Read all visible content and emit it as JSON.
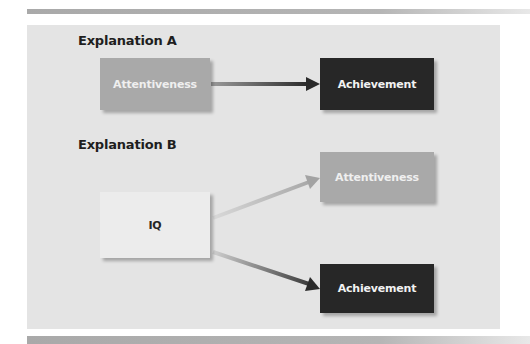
{
  "diagram": {
    "explanation_a": {
      "heading": "Explanation A",
      "nodes": [
        {
          "id": "attentiveness_a",
          "label": "Attentiveness",
          "color": "#a9a9a9"
        },
        {
          "id": "achievement_a",
          "label": "Achievement",
          "color": "#272727"
        }
      ],
      "edges": [
        {
          "from": "attentiveness_a",
          "to": "achievement_a"
        }
      ]
    },
    "explanation_b": {
      "heading": "Explanation B",
      "nodes": [
        {
          "id": "iq",
          "label": "IQ",
          "color": "#ececec"
        },
        {
          "id": "attentiveness_b",
          "label": "Attentiveness",
          "color": "#a9a9a9"
        },
        {
          "id": "achievement_b",
          "label": "Achievement",
          "color": "#272727"
        }
      ],
      "edges": [
        {
          "from": "iq",
          "to": "attentiveness_b"
        },
        {
          "from": "iq",
          "to": "achievement_b"
        }
      ]
    },
    "colors": {
      "panel_bg": "#e4e4e4",
      "heading_text": "#1e1e1e"
    }
  }
}
